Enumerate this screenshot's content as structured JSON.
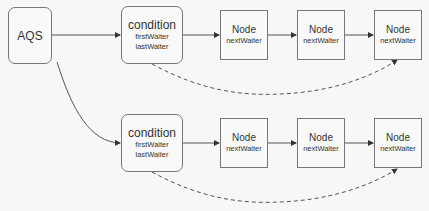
{
  "diagram": {
    "root": {
      "label": "AQS"
    },
    "conditions": [
      {
        "label": "condition",
        "fields": [
          "firstWaiter",
          "lastWaiter"
        ],
        "nodes": [
          {
            "label": "Node",
            "field": "nextWaiter"
          },
          {
            "label": "Node",
            "field": "nextWaiter"
          },
          {
            "label": "Node",
            "field": "nextWaiter"
          }
        ]
      },
      {
        "label": "condition",
        "fields": [
          "firstWaiter",
          "lastWaiter"
        ],
        "nodes": [
          {
            "label": "Node",
            "field": "nextWaiter"
          },
          {
            "label": "Node",
            "field": "nextWaiter"
          },
          {
            "label": "Node",
            "field": "nextWaiter"
          }
        ]
      }
    ],
    "edges": [
      {
        "from": "AQS",
        "to": "condition[0]",
        "style": "solid"
      },
      {
        "from": "AQS",
        "to": "condition[1]",
        "style": "solid"
      },
      {
        "from": "condition[0]",
        "to": "condition[0].node[0]",
        "style": "solid",
        "meaning": "firstWaiter"
      },
      {
        "from": "condition[0].node[0]",
        "to": "condition[0].node[1]",
        "style": "solid",
        "meaning": "nextWaiter"
      },
      {
        "from": "condition[0].node[1]",
        "to": "condition[0].node[2]",
        "style": "solid",
        "meaning": "nextWaiter"
      },
      {
        "from": "condition[0]",
        "to": "condition[0].node[2]",
        "style": "dashed",
        "meaning": "lastWaiter"
      },
      {
        "from": "condition[1]",
        "to": "condition[1].node[0]",
        "style": "solid",
        "meaning": "firstWaiter"
      },
      {
        "from": "condition[1].node[0]",
        "to": "condition[1].node[1]",
        "style": "solid",
        "meaning": "nextWaiter"
      },
      {
        "from": "condition[1].node[1]",
        "to": "condition[1].node[2]",
        "style": "solid",
        "meaning": "nextWaiter"
      },
      {
        "from": "condition[1]",
        "to": "condition[1].node[2]",
        "style": "dashed",
        "meaning": "lastWaiter"
      }
    ],
    "colors": {
      "stroke": "#555555",
      "box_border": "#777777",
      "background": "#f7f7f7",
      "text": "#333333"
    }
  }
}
